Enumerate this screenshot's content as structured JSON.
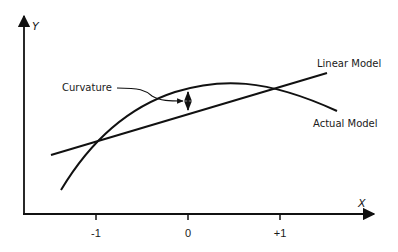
{
  "diagram": {
    "title": "",
    "axes": {
      "x_label": "X",
      "y_label": "Y",
      "x_ticks": [
        "-1",
        "0",
        "+1"
      ]
    },
    "labels": {
      "linear_model": "Linear Model",
      "actual_model": "Actual Model",
      "curvature": "Curvature"
    },
    "colors": {
      "stroke": "#111111",
      "background": "#ffffff"
    }
  }
}
